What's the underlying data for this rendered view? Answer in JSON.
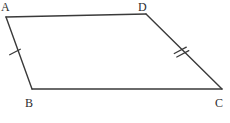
{
  "figure": {
    "kind": "geometry-diagram",
    "shape_name": "quadrilateral-ABDC",
    "background_color": "#ffffff",
    "stroke_color": "#3a3a3a",
    "label_color": "#2e2e2e",
    "stroke_width": 1.4,
    "vertices": [
      {
        "id": "A",
        "label": "A",
        "x": 6,
        "y": 17
      },
      {
        "id": "D",
        "label": "D",
        "x": 146,
        "y": 14
      },
      {
        "id": "C",
        "label": "C",
        "x": 222,
        "y": 89
      },
      {
        "id": "B",
        "label": "B",
        "x": 32,
        "y": 89
      }
    ],
    "sides": [
      {
        "id": "AD",
        "from": "A",
        "to": "D",
        "ticks": 0
      },
      {
        "id": "DC",
        "from": "D",
        "to": "C",
        "ticks": 2
      },
      {
        "id": "CB",
        "from": "C",
        "to": "B",
        "ticks": 0
      },
      {
        "id": "BA",
        "from": "B",
        "to": "A",
        "ticks": 1
      }
    ],
    "tick_marks": [
      {
        "id": "tick-AB-single",
        "on_side": "BA",
        "count": 1,
        "center_x": 15,
        "center_y": 52,
        "length": 12,
        "angle_deg": -28
      },
      {
        "id": "tick-DC-double",
        "on_side": "DC",
        "count": 2,
        "center_x": 181,
        "center_y": 52,
        "length": 12,
        "angle_deg": -48,
        "spacing": 4
      }
    ],
    "labels": {
      "A": "A",
      "B": "B",
      "C": "C",
      "D": "D"
    }
  }
}
